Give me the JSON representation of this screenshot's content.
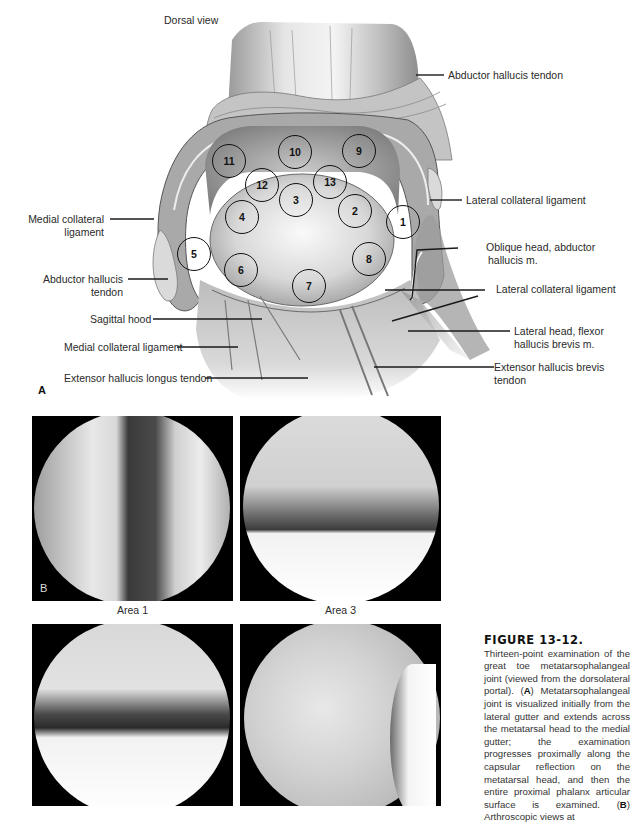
{
  "figure": {
    "number_label": "FIGURE 13-12.",
    "panel_a_letter": "A",
    "panel_b_letter": "B",
    "view_label": "Dorsal view",
    "caption": {
      "intro": "Thirteen-point examination of the great toe metatarsophalangeal joint (viewed from the dorsolateral portal).",
      "a_key": "A",
      "a_text": "Metatarsophalangeal joint is visualized initially from the lateral gutter and extends across the metatarsal head to the medial gutter; the examination progresses proximally along the capsular reflection on the metatarsal head, and then the entire proximal phalanx articular surface is examined.",
      "b_key": "B",
      "b_text": "Arthroscopic views at"
    }
  },
  "labels": {
    "abductor_hallucis_tendon_top": "Abductor hallucis tendon",
    "lateral_collateral_ligament_top": "Lateral collateral ligament",
    "medial_collateral_ligament_left_1": "Medial collateral",
    "medial_collateral_ligament_left_2": "ligament",
    "abductor_hallucis_tendon_left_1": "Abductor hallucis",
    "abductor_hallucis_tendon_left_2": "tendon",
    "oblique_head_1": "Oblique head, abductor",
    "oblique_head_2": "hallucis m.",
    "lateral_collateral_ligament_lower": "Lateral collateral ligament",
    "sagittal_hood": "Sagittal hood",
    "lateral_head_flexor_1": "Lateral head, flexor",
    "lateral_head_flexor_2": "hallucis brevis m.",
    "medial_collateral_ligament_lower": "Medial collateral ligament",
    "extensor_hallucis_brevis_1": "Extensor hallucis brevis",
    "extensor_hallucis_brevis_2": "tendon",
    "extensor_hallucis_longus": "Extensor hallucis longus tendon"
  },
  "exam_points": [
    {
      "n": "1",
      "x": 403,
      "y": 222
    },
    {
      "n": "2",
      "x": 355,
      "y": 211
    },
    {
      "n": "3",
      "x": 296,
      "y": 200
    },
    {
      "n": "4",
      "x": 242,
      "y": 217
    },
    {
      "n": "5",
      "x": 194,
      "y": 254
    },
    {
      "n": "6",
      "x": 241,
      "y": 270
    },
    {
      "n": "7",
      "x": 309,
      "y": 286
    },
    {
      "n": "8",
      "x": 369,
      "y": 259
    },
    {
      "n": "9",
      "x": 359,
      "y": 151
    },
    {
      "n": "10",
      "x": 295,
      "y": 152
    },
    {
      "n": "11",
      "x": 229,
      "y": 161
    },
    {
      "n": "12",
      "x": 262,
      "y": 185
    },
    {
      "n": "13",
      "x": 330,
      "y": 182
    }
  ],
  "photos": [
    {
      "caption": "Area 1"
    },
    {
      "caption": "Area 3"
    },
    {
      "caption": ""
    },
    {
      "caption": ""
    }
  ]
}
